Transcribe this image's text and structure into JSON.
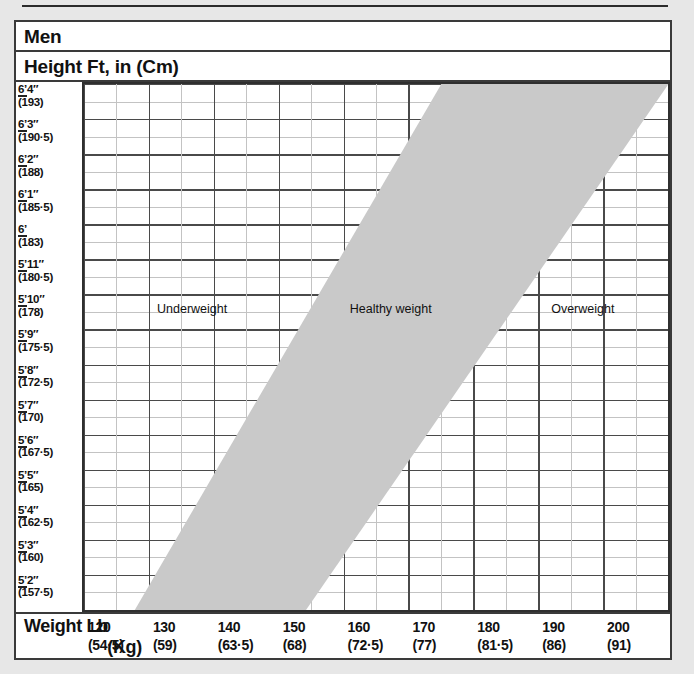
{
  "page": {
    "background_color": "#e7e7e7",
    "panel_color": "#ffffff",
    "border_color": "#3a3a3a"
  },
  "header": {
    "title": "Men",
    "axis_title": "Height Ft, in (Cm)"
  },
  "x_axis": {
    "title_lb": "Weight Lb",
    "title_kg": "(Kg)"
  },
  "chart_data": {
    "type": "area",
    "title": "Men",
    "ylabel": "Height Ft, in (Cm)",
    "xlabel": "Weight Lb (Kg)",
    "grid": true,
    "legend": "none",
    "band_color": "#c9c9c9",
    "xlim": [
      115,
      205
    ],
    "ylim": [
      156.25,
      194.25
    ],
    "x_ticks": [
      {
        "lb": "120",
        "kg": "(54·5)"
      },
      {
        "lb": "130",
        "kg": "(59)"
      },
      {
        "lb": "140",
        "kg": "(63·5)"
      },
      {
        "lb": "150",
        "kg": "(68)"
      },
      {
        "lb": "160",
        "kg": "(72·5)"
      },
      {
        "lb": "170",
        "kg": "(77)"
      },
      {
        "lb": "180",
        "kg": "(81·5)"
      },
      {
        "lb": "190",
        "kg": "(86)"
      },
      {
        "lb": "200",
        "kg": "(91)"
      }
    ],
    "y_ticks": [
      {
        "ft": "6’4″",
        "cm": "(193)"
      },
      {
        "ft": "6’3″",
        "cm": "(190·5)"
      },
      {
        "ft": "6’2″",
        "cm": "(188)"
      },
      {
        "ft": "6’1″",
        "cm": "(185·5)"
      },
      {
        "ft": "6’",
        "cm": "(183)"
      },
      {
        "ft": "5’11″",
        "cm": "(180·5)"
      },
      {
        "ft": "5’10″",
        "cm": "(178)"
      },
      {
        "ft": "5’9″",
        "cm": "(175·5)"
      },
      {
        "ft": "5’8″",
        "cm": "(172·5)"
      },
      {
        "ft": "5’7″",
        "cm": "(170)"
      },
      {
        "ft": "5’6″",
        "cm": "(167·5)"
      },
      {
        "ft": "5’5″",
        "cm": "(165)"
      },
      {
        "ft": "5’4″",
        "cm": "(162·5)"
      },
      {
        "ft": "5’3″",
        "cm": "(160)"
      },
      {
        "ft": "5’2″",
        "cm": "(157·5)"
      }
    ],
    "zones": [
      {
        "label": "Underweight",
        "x_pct": 12.5,
        "y_pct": 41.5
      },
      {
        "label": "Healthy weight",
        "x_pct": 45.5,
        "y_pct": 41.5
      },
      {
        "label": "Overweight",
        "x_pct": 80.0,
        "y_pct": 41.5
      }
    ],
    "healthy_band": {
      "description": "Shaded diagonal band marking the healthy weight range; lower-left boundary runs from about 118 lb at 5’2″ up to about 168 lb at 6’4″, upper-right boundary from about 143 lb at 5’2″ up to about 205 lb at 6’4″",
      "lower_bound_points": [
        [
          119,
          157.5
        ],
        [
          168,
          193
        ]
      ],
      "upper_bound_points": [
        [
          144,
          157.5
        ],
        [
          205,
          193
        ]
      ]
    }
  }
}
